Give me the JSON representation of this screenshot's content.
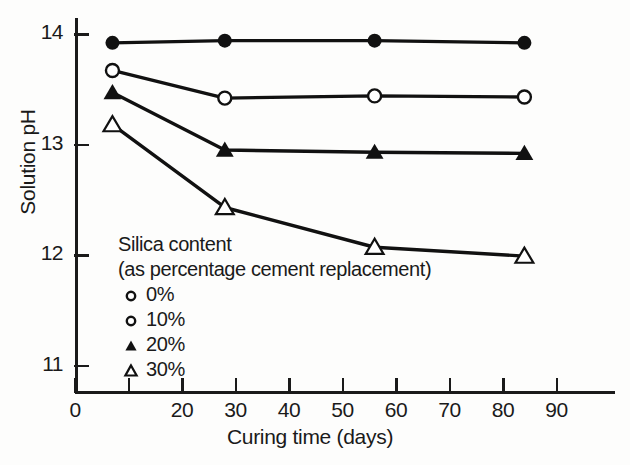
{
  "chart_data": {
    "type": "line",
    "title": "",
    "xlabel": "Curing time (days)",
    "ylabel": "Solution pH",
    "xlim": [
      0,
      95
    ],
    "ylim": [
      10.6,
      14.35
    ],
    "grid": false,
    "legend_position": "inside-lower-left",
    "legend_title_line1": "Silica content",
    "legend_title_line2": "(as percentage cement replacement)",
    "x": [
      7,
      28,
      56,
      84
    ],
    "xticks": [
      0,
      10,
      20,
      30,
      40,
      50,
      60,
      70,
      80,
      90
    ],
    "xtick_labels": [
      "0",
      "",
      "20",
      "30",
      "40",
      "50",
      "60",
      "70",
      "80",
      "90"
    ],
    "yticks": [
      11,
      12,
      13,
      14
    ],
    "ytick_labels": [
      "11",
      "12",
      "13",
      "14"
    ],
    "series": [
      {
        "name": "0%",
        "marker": "filled-circle",
        "values": [
          13.92,
          13.94,
          13.94,
          13.92
        ]
      },
      {
        "name": "10%",
        "marker": "open-circle",
        "values": [
          13.67,
          13.42,
          13.44,
          13.43
        ]
      },
      {
        "name": "20%",
        "marker": "filled-triangle",
        "values": [
          13.47,
          12.95,
          12.93,
          12.92
        ]
      },
      {
        "name": "30%",
        "marker": "open-triangle",
        "values": [
          13.18,
          12.43,
          12.07,
          11.99
        ]
      }
    ]
  },
  "legend": {
    "title_line1": "Silica content",
    "title_line2": "(as percentage cement replacement)",
    "entries": [
      {
        "label": "0%",
        "marker": "open-circle-small"
      },
      {
        "label": "10%",
        "marker": "open-circle-small"
      },
      {
        "label": "20%",
        "marker": "filled-triangle-small"
      },
      {
        "label": "30%",
        "marker": "open-triangle-small"
      }
    ]
  },
  "axes": {
    "y_title": "Solution pH",
    "x_title": "Curing time (days)"
  }
}
